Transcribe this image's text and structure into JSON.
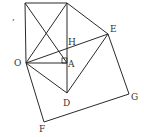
{
  "diagram": {
    "type": "geometry-figure",
    "stroke_color": "#2a2a2a",
    "label_color": "#333333",
    "points": {
      "C": {
        "x": 25,
        "y": 3
      },
      "B": {
        "x": 67,
        "y": 3
      },
      "O": {
        "x": 26,
        "y": 63
      },
      "A": {
        "x": 67,
        "y": 63
      },
      "H": {
        "x": 67,
        "y": 45
      },
      "E": {
        "x": 108,
        "y": 34
      },
      "D": {
        "x": 67,
        "y": 93
      },
      "G": {
        "x": 129,
        "y": 94
      },
      "F": {
        "x": 44,
        "y": 122
      }
    },
    "labels": {
      "O": "O",
      "A": "A",
      "H": "H",
      "E": "E",
      "D": "D",
      "G": "G",
      "F": "F",
      "mark": ","
    },
    "segments": [
      [
        "C",
        "B"
      ],
      [
        "C",
        "O"
      ],
      [
        "B",
        "D"
      ],
      [
        "O",
        "A"
      ],
      [
        "C",
        "A"
      ],
      [
        "O",
        "B"
      ],
      [
        "B",
        "E"
      ],
      [
        "O",
        "E"
      ],
      [
        "E",
        "D"
      ],
      [
        "O",
        "D"
      ],
      [
        "E",
        "G"
      ],
      [
        "G",
        "F"
      ],
      [
        "F",
        "O"
      ]
    ],
    "right_angle_marker": {
      "at": "A",
      "size": 5
    }
  }
}
